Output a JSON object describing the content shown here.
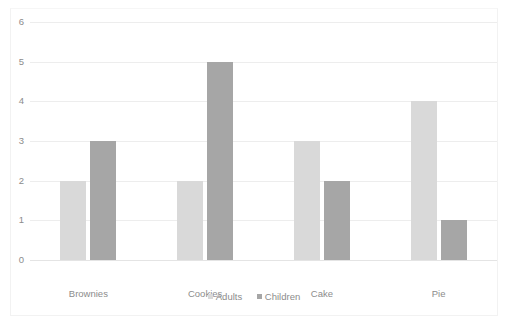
{
  "chart_data": {
    "type": "bar",
    "title": "",
    "xlabel": "",
    "ylabel": "",
    "categories": [
      "Brownies",
      "Cookies",
      "Cake",
      "Pie"
    ],
    "series": [
      {
        "name": "Adults",
        "color": "#D9D9D9",
        "values": [
          2,
          2,
          3,
          4
        ]
      },
      {
        "name": "Children",
        "color": "#A6A6A6",
        "values": [
          3,
          5,
          2,
          1
        ]
      }
    ],
    "ylim": [
      0,
      6
    ],
    "ytick_labels": [
      "6",
      "5",
      "4",
      "3",
      "2",
      "1",
      "0"
    ],
    "ytick_values": [
      6,
      5,
      4,
      3,
      2,
      1,
      0
    ],
    "grid": true,
    "legend_position": "bottom"
  },
  "legend": {
    "items": [
      {
        "label": "Adults"
      },
      {
        "label": "Children"
      }
    ]
  },
  "colors": {
    "adults": "#D9D9D9",
    "children": "#A6A6A6",
    "gridline": "#EDEDED",
    "text": "#8c8c8c",
    "background": "#FFFFFF"
  }
}
